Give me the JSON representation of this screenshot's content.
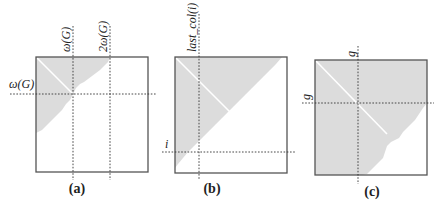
{
  "figure": {
    "panels": [
      {
        "id": "a",
        "caption": "(a)",
        "vertical_labels": [
          "ω(G)",
          "2ω(G)"
        ],
        "horizontal_label": "ω(G)"
      },
      {
        "id": "b",
        "caption": "(b)",
        "vertical_labels": [
          "last_col(i)"
        ],
        "horizontal_label": "i"
      },
      {
        "id": "c",
        "caption": "(c)",
        "vertical_labels": [
          "g"
        ],
        "horizontal_label": "g"
      }
    ]
  }
}
